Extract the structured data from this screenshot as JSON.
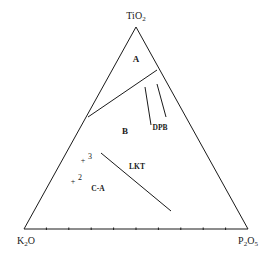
{
  "diagram": {
    "type": "ternary",
    "vertices": {
      "top": {
        "label_main": "TiO",
        "label_sub": "2",
        "x": 136,
        "y": 27
      },
      "left": {
        "label_main": "K",
        "label_sub": "2",
        "label_tail": "O",
        "x": 24,
        "y": 229
      },
      "right": {
        "label_main": "P",
        "label_sub": "2",
        "label_tail": "O",
        "label_sub2": "5",
        "x": 248,
        "y": 229
      }
    },
    "base_ticks": 10,
    "line_color": "#1a1a1a",
    "boundary_A": {
      "x1": 157,
      "y1": 70,
      "x2": 88,
      "y2": 117
    },
    "dpb_lines": [
      {
        "x1": 145,
        "y1": 87,
        "x2": 151,
        "y2": 125
      },
      {
        "x1": 157,
        "y1": 84,
        "x2": 166,
        "y2": 117
      }
    ],
    "lkt_line": {
      "x1": 101,
      "y1": 153,
      "x2": 171,
      "y2": 211
    },
    "fields": [
      {
        "label": "A",
        "x": 136,
        "y": 62
      },
      {
        "label": "B",
        "x": 125,
        "y": 134
      },
      {
        "label": "DPB",
        "x": 160,
        "y": 130
      },
      {
        "label": "LKT",
        "x": 137,
        "y": 169
      },
      {
        "label": "C-A",
        "x": 98,
        "y": 191
      }
    ],
    "points": [
      {
        "marker": "+",
        "label": "3",
        "x": 83,
        "y": 160
      },
      {
        "marker": "+",
        "label": "2",
        "x": 73,
        "y": 181
      }
    ]
  }
}
